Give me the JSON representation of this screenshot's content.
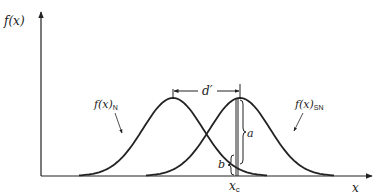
{
  "figure": {
    "type": "signal-detection-theory-diagram",
    "y_axis_label": "f(x)",
    "x_axis_label": "x",
    "curves": [
      {
        "id": "noise",
        "label_main": "f(x)",
        "label_sub": "N",
        "mean_px": 173
      },
      {
        "id": "signal_noise",
        "label_main": "f(x)",
        "label_sub": "SN",
        "mean_px": 240
      }
    ],
    "separation_label": "d′",
    "criterion_label_main": "x",
    "criterion_label_sub": "c",
    "brace_a_label": "a",
    "brace_b_label": "b",
    "colors": {
      "ink": "#222222",
      "background": "#ffffff"
    }
  }
}
